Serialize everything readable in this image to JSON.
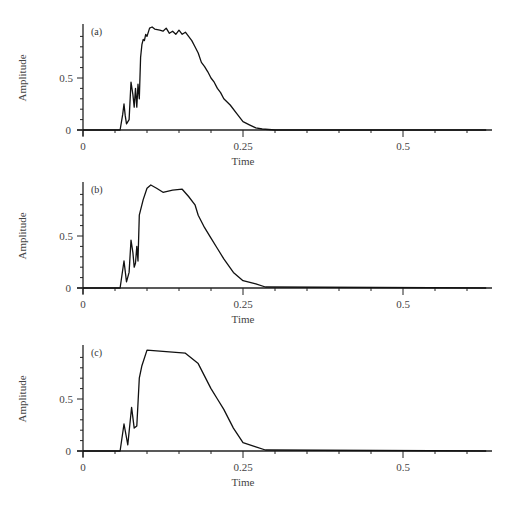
{
  "chart_data": [
    {
      "type": "line",
      "panel_label": "(a)",
      "xlabel": "Time",
      "ylabel": "Amplitude",
      "xticks": [
        "0",
        "0.25",
        "0.5"
      ],
      "yticks": [
        "0",
        "0.5"
      ],
      "xlim": [
        0,
        0.63
      ],
      "ylim": [
        0,
        1.0
      ],
      "grid": false,
      "x": [
        0,
        0.058,
        0.062,
        0.064,
        0.066,
        0.068,
        0.072,
        0.075,
        0.078,
        0.08,
        0.082,
        0.084,
        0.086,
        0.088,
        0.09,
        0.092,
        0.094,
        0.096,
        0.098,
        0.1,
        0.104,
        0.108,
        0.112,
        0.12,
        0.125,
        0.13,
        0.135,
        0.14,
        0.145,
        0.15,
        0.155,
        0.16,
        0.165,
        0.17,
        0.175,
        0.18,
        0.185,
        0.19,
        0.195,
        0.2,
        0.205,
        0.21,
        0.215,
        0.22,
        0.23,
        0.24,
        0.25,
        0.26,
        0.27,
        0.28,
        0.29,
        0.3,
        0.63
      ],
      "y": [
        0,
        0,
        0.15,
        0.25,
        0.14,
        0.06,
        0.1,
        0.46,
        0.34,
        0.22,
        0.4,
        0.22,
        0.44,
        0.3,
        0.7,
        0.82,
        0.87,
        0.86,
        0.92,
        0.9,
        0.98,
        0.99,
        0.97,
        0.96,
        0.95,
        0.98,
        0.93,
        0.95,
        0.92,
        0.96,
        0.92,
        0.94,
        0.9,
        0.86,
        0.8,
        0.74,
        0.65,
        0.61,
        0.56,
        0.5,
        0.46,
        0.4,
        0.36,
        0.3,
        0.24,
        0.16,
        0.08,
        0.05,
        0.02,
        0.01,
        0.005,
        0,
        0
      ]
    },
    {
      "type": "line",
      "panel_label": "(b)",
      "xlabel": "Time",
      "ylabel": "Amplitude",
      "xticks": [
        "0",
        "0.25",
        "0.5"
      ],
      "yticks": [
        "0",
        "0.5"
      ],
      "xlim": [
        0,
        0.63
      ],
      "ylim": [
        0,
        1.0
      ],
      "grid": false,
      "x": [
        0,
        0.058,
        0.064,
        0.068,
        0.072,
        0.075,
        0.078,
        0.08,
        0.082,
        0.084,
        0.086,
        0.088,
        0.094,
        0.1,
        0.106,
        0.115,
        0.125,
        0.14,
        0.155,
        0.165,
        0.175,
        0.18,
        0.19,
        0.2,
        0.21,
        0.22,
        0.235,
        0.25,
        0.27,
        0.285,
        0.63
      ],
      "y": [
        0,
        0,
        0.26,
        0.06,
        0.15,
        0.46,
        0.34,
        0.2,
        0.24,
        0.4,
        0.26,
        0.7,
        0.85,
        0.96,
        0.99,
        0.96,
        0.92,
        0.94,
        0.95,
        0.88,
        0.8,
        0.7,
        0.58,
        0.48,
        0.38,
        0.28,
        0.15,
        0.07,
        0.04,
        0.01,
        0
      ]
    },
    {
      "type": "line",
      "panel_label": "(c)",
      "xlabel": "Time",
      "ylabel": "Amplitude",
      "xticks": [
        "0",
        "0.25",
        "0.5"
      ],
      "yticks": [
        "0",
        "0.5"
      ],
      "xlim": [
        0,
        0.63
      ],
      "ylim": [
        0,
        1.0
      ],
      "grid": false,
      "x": [
        0,
        0.058,
        0.064,
        0.07,
        0.076,
        0.08,
        0.084,
        0.088,
        0.092,
        0.1,
        0.16,
        0.18,
        0.19,
        0.2,
        0.21,
        0.22,
        0.235,
        0.25,
        0.27,
        0.285,
        0.63
      ],
      "y": [
        0,
        0,
        0.26,
        0.06,
        0.42,
        0.22,
        0.24,
        0.7,
        0.82,
        0.97,
        0.94,
        0.84,
        0.72,
        0.6,
        0.5,
        0.4,
        0.22,
        0.08,
        0.04,
        0.01,
        0
      ]
    }
  ],
  "labels": {
    "panels": [
      "(a)",
      "(b)",
      "(c)"
    ],
    "xlabel": "Time",
    "ylabel": "Amplitude",
    "xtick_0": "0",
    "xtick_025": "0.25",
    "xtick_05": "0.5",
    "ytick_0": "0",
    "ytick_05": "0.5"
  }
}
